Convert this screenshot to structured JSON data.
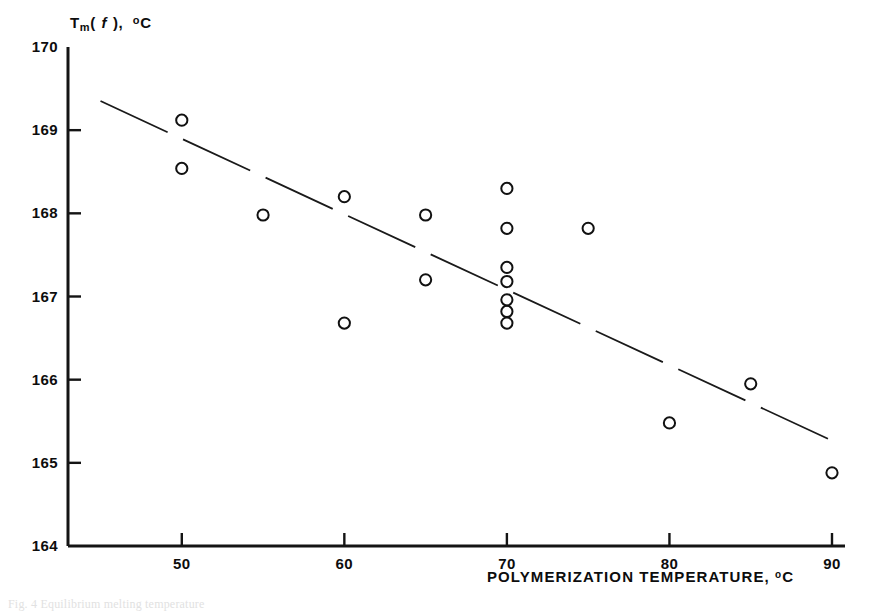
{
  "figure": {
    "background": "#ffffff",
    "ink": "#111111",
    "caption_partial": "Fig. 4  Equilibrium melting temperature"
  },
  "axes": {
    "y": {
      "title_prefix": "T",
      "title_sub": "m",
      "title_paren_open": "( ",
      "title_var": "f",
      "title_paren_close": " ),",
      "title_deg": "o",
      "title_unit": "C",
      "title_plain": "Tm(f), oC",
      "ticks": [
        "170",
        "169",
        "168",
        "167",
        "166",
        "165",
        "164"
      ],
      "tick_values": [
        170,
        169,
        168,
        167,
        166,
        165,
        164
      ],
      "min": 164,
      "max": 170
    },
    "x": {
      "title": "POLYMERIZATION TEMPERATURE,",
      "title_deg": "o",
      "title_unit": "C",
      "ticks": [
        "50",
        "60",
        "70",
        "80",
        "90"
      ],
      "tick_values": [
        50,
        60,
        70,
        80,
        90
      ],
      "min": 43,
      "max": 90.8
    }
  },
  "chart_data": {
    "type": "scatter",
    "title": "",
    "xlabel": "POLYMERIZATION TEMPERATURE, °C",
    "ylabel": "Tm(f), °C",
    "xlim": [
      43,
      90.8
    ],
    "ylim": [
      164,
      170
    ],
    "xticks": [
      50,
      60,
      70,
      80,
      90
    ],
    "yticks": [
      164,
      165,
      166,
      167,
      168,
      169,
      170
    ],
    "grid": false,
    "legend": null,
    "marker": "open-circle",
    "series": [
      {
        "name": "measured melting temperature",
        "marker": "open-circle",
        "points": [
          {
            "x": 50,
            "y": 169.12
          },
          {
            "x": 50,
            "y": 168.54
          },
          {
            "x": 55,
            "y": 167.98
          },
          {
            "x": 60,
            "y": 168.2
          },
          {
            "x": 60,
            "y": 166.68
          },
          {
            "x": 65,
            "y": 167.98
          },
          {
            "x": 65,
            "y": 167.2
          },
          {
            "x": 70,
            "y": 168.3
          },
          {
            "x": 70,
            "y": 167.82
          },
          {
            "x": 70,
            "y": 167.35
          },
          {
            "x": 70,
            "y": 167.18
          },
          {
            "x": 70,
            "y": 166.96
          },
          {
            "x": 70,
            "y": 166.82
          },
          {
            "x": 70,
            "y": 166.68
          },
          {
            "x": 75,
            "y": 167.82
          },
          {
            "x": 80,
            "y": 165.48
          },
          {
            "x": 85,
            "y": 165.95
          },
          {
            "x": 90,
            "y": 164.88
          }
        ]
      }
    ],
    "trend_line": {
      "name": "least-squares fit",
      "style": "dashed",
      "x_start": 45.0,
      "y_start": 169.35,
      "x_end": 90.3,
      "y_end": 165.24,
      "slope": -0.0907
    }
  }
}
